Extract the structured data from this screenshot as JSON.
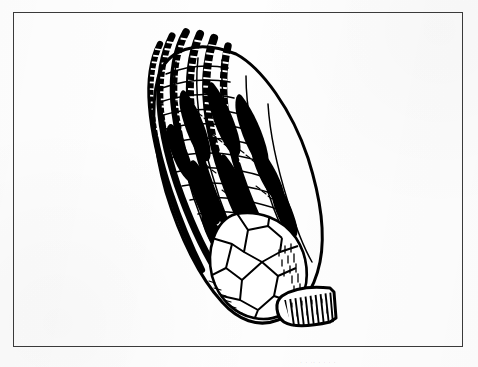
{
  "document": {
    "kind": "scanned-figure",
    "page_background": "#fefefe",
    "ink_color": "#000000",
    "frame_color": "#3a3a3a"
  },
  "frame": {
    "x": 13,
    "y": 12,
    "width": 450,
    "height": 335,
    "border_width": 1.6
  },
  "caption_ghost": {
    "text": ". .  ..     .   .  .          .",
    "y": 356
  },
  "figure": {
    "technique": "pen-and-ink-line-drawing",
    "orientation_degrees": -34,
    "bounds": {
      "x": 145,
      "y": 30,
      "width": 190,
      "height": 296
    },
    "parts": [
      {
        "name": "arm-tips",
        "label": "arm tips"
      },
      {
        "name": "arms",
        "label": "arms with segmented brachials"
      },
      {
        "name": "pinnules",
        "label": "pinnules"
      },
      {
        "name": "tegmen",
        "label": "tegmen"
      },
      {
        "name": "calyx",
        "label": "calyx with polygonal plates"
      },
      {
        "name": "column",
        "label": "columnal stem"
      }
    ]
  },
  "chart_data": {
    "type": "line-drawing",
    "title": "",
    "subtitle": "",
    "xlabel": "",
    "ylabel": "",
    "legend": [],
    "annotations": [],
    "grid": false
  }
}
